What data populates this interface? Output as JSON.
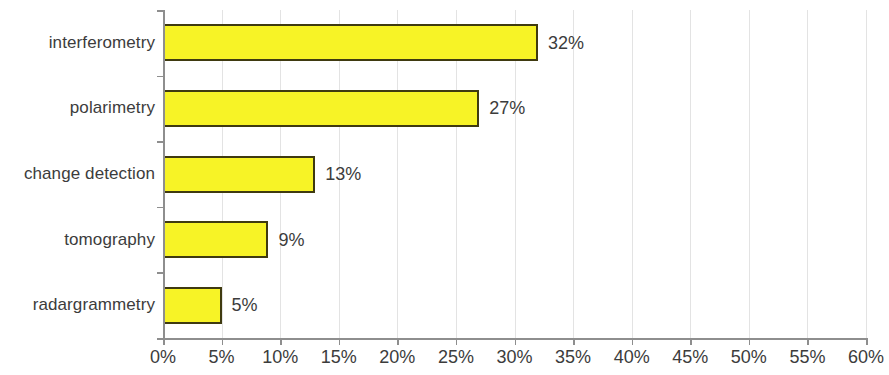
{
  "chart_data": {
    "type": "bar",
    "orientation": "horizontal",
    "title": "",
    "subtitle": "",
    "xlabel": "",
    "ylabel": "",
    "categories": [
      "interferometry",
      "polarimetry",
      "change detection",
      "tomography",
      "radargrammetry"
    ],
    "values": [
      32,
      27,
      13,
      9,
      5
    ],
    "value_labels": [
      "32%",
      "27%",
      "13%",
      "9%",
      "5%"
    ],
    "xlim": [
      0,
      60
    ],
    "xtick_values": [
      0,
      5,
      10,
      15,
      20,
      25,
      30,
      35,
      40,
      45,
      50,
      55,
      60
    ],
    "xtick_labels": [
      "0%",
      "5%",
      "10%",
      "15%",
      "20%",
      "25%",
      "30%",
      "35%",
      "40%",
      "45%",
      "50%",
      "55%",
      "60%"
    ],
    "grid": true,
    "grid_axis": "x",
    "legend": false,
    "legend_position": "none",
    "series": [
      {
        "name": "",
        "values": [
          32,
          27,
          13,
          9,
          5
        ]
      }
    ],
    "colors": {
      "bar_fill": "#F7F326",
      "bar_border": "#3f3a10",
      "gridline": "#e3e3e3",
      "axis": "#8e8e8e",
      "text": "#3c3c3c",
      "background": "#ffffff"
    }
  }
}
